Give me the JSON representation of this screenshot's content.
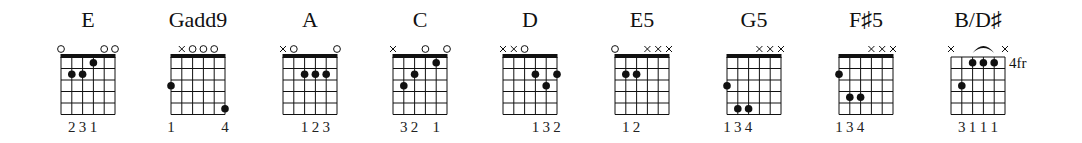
{
  "colors": {
    "ink": "#111111",
    "background": "#ffffff"
  },
  "grid": {
    "strings": 6,
    "frets": 5,
    "string_spacing": 10.8,
    "fret_spacing": 11.5,
    "top": 57
  },
  "chords": [
    {
      "name": "E",
      "left": 61,
      "nut": true,
      "markers": [
        "o",
        "",
        "",
        "",
        "o",
        "o"
      ],
      "dots": [
        {
          "string": 2,
          "fret": 2
        },
        {
          "string": 3,
          "fret": 2
        },
        {
          "string": 4,
          "fret": 1
        }
      ],
      "fingers": [
        {
          "string": 2,
          "label": "2"
        },
        {
          "string": 3,
          "label": "3"
        },
        {
          "string": 4,
          "label": "1"
        }
      ]
    },
    {
      "name": "Gadd9",
      "left": 171,
      "nut": true,
      "markers": [
        "",
        "x",
        "o",
        "o",
        "o",
        ""
      ],
      "dots": [
        {
          "string": 1,
          "fret": 3
        },
        {
          "string": 6,
          "fret": 5
        }
      ],
      "fingers": [
        {
          "string": 1,
          "label": "1"
        },
        {
          "string": 6,
          "label": "4"
        }
      ]
    },
    {
      "name": "A",
      "left": 283,
      "nut": true,
      "markers": [
        "x",
        "o",
        "",
        "",
        "",
        "o"
      ],
      "dots": [
        {
          "string": 3,
          "fret": 2
        },
        {
          "string": 4,
          "fret": 2
        },
        {
          "string": 5,
          "fret": 2
        }
      ],
      "fingers": [
        {
          "string": 3,
          "label": "1"
        },
        {
          "string": 4,
          "label": "2"
        },
        {
          "string": 5,
          "label": "3"
        }
      ]
    },
    {
      "name": "C",
      "left": 393,
      "nut": true,
      "markers": [
        "x",
        "",
        "",
        "o",
        "",
        "o"
      ],
      "dots": [
        {
          "string": 2,
          "fret": 3
        },
        {
          "string": 3,
          "fret": 2
        },
        {
          "string": 5,
          "fret": 1
        }
      ],
      "fingers": [
        {
          "string": 2,
          "label": "3"
        },
        {
          "string": 3,
          "label": "2"
        },
        {
          "string": 5,
          "label": "1"
        }
      ]
    },
    {
      "name": "D",
      "left": 503,
      "nut": true,
      "markers": [
        "x",
        "x",
        "o",
        "",
        "",
        ""
      ],
      "dots": [
        {
          "string": 4,
          "fret": 2
        },
        {
          "string": 5,
          "fret": 3
        },
        {
          "string": 6,
          "fret": 2
        }
      ],
      "fingers": [
        {
          "string": 4,
          "label": "1"
        },
        {
          "string": 5,
          "label": "3"
        },
        {
          "string": 6,
          "label": "2"
        }
      ]
    },
    {
      "name": "E5",
      "left": 615,
      "nut": true,
      "markers": [
        "o",
        "",
        "",
        "x",
        "x",
        "x"
      ],
      "dots": [
        {
          "string": 2,
          "fret": 2
        },
        {
          "string": 3,
          "fret": 2
        }
      ],
      "fingers": [
        {
          "string": 2,
          "label": "1"
        },
        {
          "string": 3,
          "label": "2"
        }
      ]
    },
    {
      "name": "G5",
      "left": 727,
      "nut": true,
      "markers": [
        "",
        "",
        "",
        "x",
        "x",
        "x"
      ],
      "dots": [
        {
          "string": 1,
          "fret": 3
        },
        {
          "string": 2,
          "fret": 5
        },
        {
          "string": 3,
          "fret": 5
        }
      ],
      "fingers": [
        {
          "string": 1,
          "label": "1"
        },
        {
          "string": 2,
          "label": "3"
        },
        {
          "string": 3,
          "label": "4"
        }
      ]
    },
    {
      "name": "F♯5",
      "left": 839,
      "nut": true,
      "markers": [
        "",
        "",
        "",
        "x",
        "x",
        "x"
      ],
      "dots": [
        {
          "string": 1,
          "fret": 2
        },
        {
          "string": 2,
          "fret": 4
        },
        {
          "string": 3,
          "fret": 4
        }
      ],
      "fingers": [
        {
          "string": 1,
          "label": "1"
        },
        {
          "string": 2,
          "label": "3"
        },
        {
          "string": 3,
          "label": "4"
        }
      ]
    },
    {
      "name": "B/D♯",
      "left": 951,
      "nut": false,
      "position_label": "4fr",
      "markers": [
        "x",
        "",
        "",
        "",
        "",
        "x"
      ],
      "barre": {
        "from": 3,
        "to": 5,
        "fret": 1
      },
      "dots": [
        {
          "string": 2,
          "fret": 3
        },
        {
          "string": 3,
          "fret": 1
        },
        {
          "string": 4,
          "fret": 1
        },
        {
          "string": 5,
          "fret": 1
        }
      ],
      "fingers": [
        {
          "string": 2,
          "label": "3"
        },
        {
          "string": 3,
          "label": "1"
        },
        {
          "string": 4,
          "label": "1"
        },
        {
          "string": 5,
          "label": "1"
        }
      ]
    }
  ]
}
